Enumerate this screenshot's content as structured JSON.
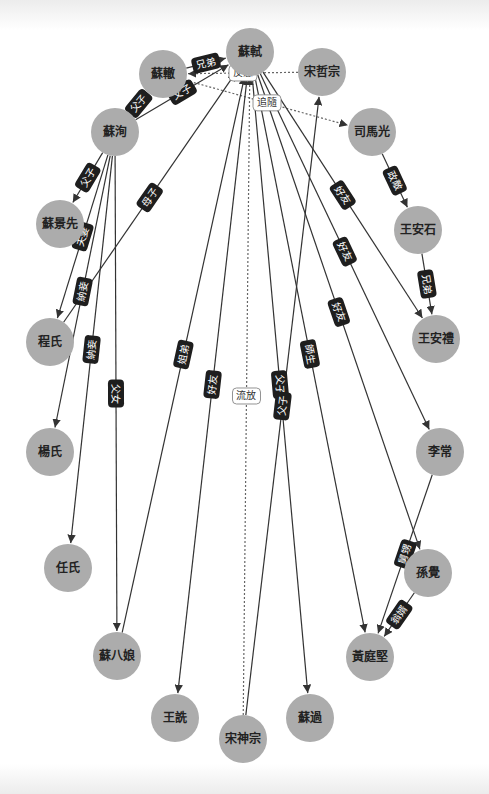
{
  "colors": {
    "node_fill": "#acacac",
    "edge": "#333333",
    "label_bg": "#1e1e1e",
    "label_text": "#ffffff"
  },
  "nodes": [
    {
      "id": "sushi",
      "label": "蘇軾",
      "x": 250,
      "y": 52
    },
    {
      "id": "suzhe",
      "label": "蘇轍",
      "x": 163,
      "y": 74
    },
    {
      "id": "zhezong",
      "label": "宋哲宗",
      "x": 322,
      "y": 72
    },
    {
      "id": "suxun",
      "label": "蘇洵",
      "x": 115,
      "y": 132
    },
    {
      "id": "simaguang",
      "label": "司馬光",
      "x": 372,
      "y": 132
    },
    {
      "id": "sujingxian",
      "label": "蘇景先",
      "x": 60,
      "y": 224
    },
    {
      "id": "wanganshi",
      "label": "王安石",
      "x": 418,
      "y": 230
    },
    {
      "id": "chengshi",
      "label": "程氏",
      "x": 50,
      "y": 342
    },
    {
      "id": "wanganli",
      "label": "王安禮",
      "x": 436,
      "y": 339
    },
    {
      "id": "yangshi",
      "label": "楊氏",
      "x": 50,
      "y": 452
    },
    {
      "id": "lichang",
      "label": "李常",
      "x": 440,
      "y": 452
    },
    {
      "id": "renshi",
      "label": "任氏",
      "x": 68,
      "y": 568
    },
    {
      "id": "sunjue",
      "label": "孫覺",
      "x": 428,
      "y": 573
    },
    {
      "id": "subaniang",
      "label": "蘇八娘",
      "x": 117,
      "y": 656
    },
    {
      "id": "huangtingjian",
      "label": "黃庭堅",
      "x": 370,
      "y": 657
    },
    {
      "id": "wangshen",
      "label": "王詵",
      "x": 175,
      "y": 718
    },
    {
      "id": "suguo",
      "label": "蘇過",
      "x": 310,
      "y": 718
    },
    {
      "id": "shenzong",
      "label": "宋神宗",
      "x": 243,
      "y": 739
    }
  ],
  "edges": [
    {
      "from": "suzhe",
      "to": "sushi",
      "label": "兄弟",
      "style": "solid",
      "arrow": true
    },
    {
      "from": "zhezong",
      "to": "suzhe",
      "label": "反感",
      "style": "dashed",
      "arrow": true
    },
    {
      "from": "suzhe",
      "to": "simaguang",
      "label": "追隨",
      "style": "dashed",
      "arrow": true
    },
    {
      "from": "suxun",
      "to": "suzhe",
      "label": "父子",
      "style": "solid",
      "arrow": true
    },
    {
      "from": "suxun",
      "to": "sushi",
      "label": "父子",
      "style": "solid",
      "arrow": true
    },
    {
      "from": "suxun",
      "to": "sujingxian",
      "label": "父子",
      "style": "solid",
      "arrow": true
    },
    {
      "from": "suxun",
      "to": "chengshi",
      "label": "夫妻",
      "style": "solid",
      "arrow": true
    },
    {
      "from": "suxun",
      "to": "yangshi",
      "label": "納妾",
      "style": "solid",
      "arrow": true
    },
    {
      "from": "suxun",
      "to": "renshi",
      "label": "納妾",
      "style": "solid",
      "arrow": true
    },
    {
      "from": "suxun",
      "to": "subaniang",
      "label": "父女",
      "style": "solid",
      "arrow": true
    },
    {
      "from": "chengshi",
      "to": "sushi",
      "label": "母子",
      "style": "solid",
      "arrow": true
    },
    {
      "from": "subaniang",
      "to": "sushi",
      "label": "姐弟",
      "style": "solid",
      "arrow": true
    },
    {
      "from": "sushi",
      "to": "wangshen",
      "label": "好友",
      "style": "solid",
      "arrow": true
    },
    {
      "from": "shenzong",
      "to": "sushi",
      "label": "流放",
      "style": "dashed",
      "arrow": true
    },
    {
      "from": "sushi",
      "to": "suguo",
      "label": "父子",
      "style": "solid",
      "arrow": true
    },
    {
      "from": "shenzong",
      "to": "zhezong",
      "label": "父子",
      "style": "solid",
      "arrow": true
    },
    {
      "from": "sushi",
      "to": "huangtingjian",
      "label": "師生",
      "style": "solid",
      "arrow": true
    },
    {
      "from": "sushi",
      "to": "sunjue",
      "label": "好友",
      "style": "solid",
      "arrow": true
    },
    {
      "from": "sushi",
      "to": "lichang",
      "label": "好友",
      "style": "solid",
      "arrow": true
    },
    {
      "from": "sushi",
      "to": "wanganli",
      "label": "好友",
      "style": "solid",
      "arrow": true
    },
    {
      "from": "simaguang",
      "to": "wanganshi",
      "label": "政敵",
      "style": "solid",
      "arrow": true
    },
    {
      "from": "wanganshi",
      "to": "wanganli",
      "label": "兄弟",
      "style": "solid",
      "arrow": true
    },
    {
      "from": "lichang",
      "to": "huangtingjian",
      "label": "舅甥",
      "style": "solid",
      "arrow": true
    },
    {
      "from": "sunjue",
      "to": "huangtingjian",
      "label": "翁婿",
      "style": "solid",
      "arrow": true
    }
  ]
}
